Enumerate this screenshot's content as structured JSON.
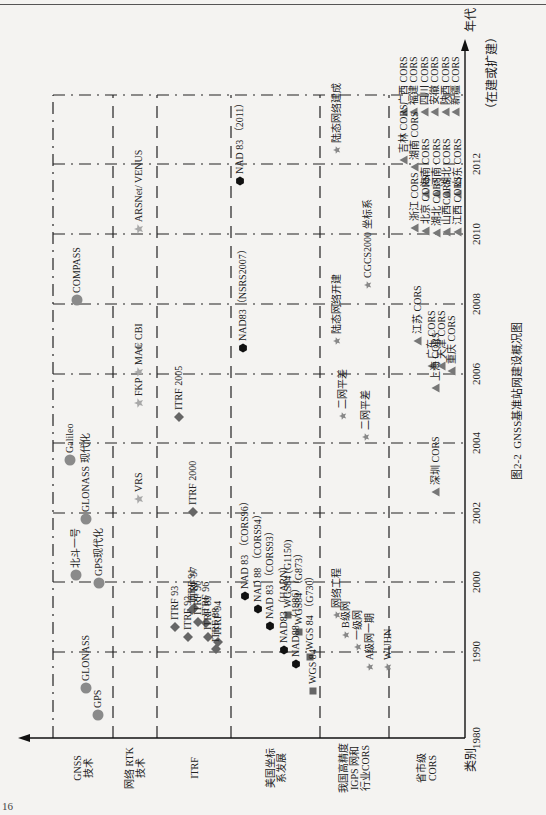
{
  "figure": {
    "caption_number": "图2-2",
    "caption_title": "GNSS基准站网建设概况图",
    "page_number": "16"
  },
  "axes": {
    "x_axis_label": "年代",
    "y_axis_label": "类别",
    "future_label": "（在建或扩建）",
    "years": [
      {
        "label": "1980",
        "x": 77
      },
      {
        "label": "1990",
        "x": 163
      },
      {
        "label": "2000",
        "x": 233
      },
      {
        "label": "2002",
        "x": 302
      },
      {
        "label": "2004",
        "x": 372
      },
      {
        "label": "2006",
        "x": 441
      },
      {
        "label": "2008",
        "x": 511
      },
      {
        "label": "2010",
        "x": 581
      },
      {
        "label": "2012",
        "x": 651
      }
    ]
  },
  "categories": [
    {
      "id": "gnss",
      "label": "GNSS\n技术",
      "y0": 53,
      "y1": 113
    },
    {
      "id": "rtk",
      "label": "网络 RTK\n技术",
      "y0": 113,
      "y1": 157
    },
    {
      "id": "itrf",
      "label": "ITRF",
      "y0": 157,
      "y1": 231
    },
    {
      "id": "nad",
      "label": "美国坐标\n系发展",
      "y0": 231,
      "y1": 320
    },
    {
      "id": "igps",
      "label": "我国高精度\nIGPS 网和\n行业CORS",
      "y0": 320,
      "y1": 389
    },
    {
      "id": "cors",
      "label": "省市级\nCORS",
      "y0": 389,
      "y1": 465
    }
  ],
  "colors": {
    "gnss_circle": "#8a8a8a",
    "rtk_star": "#a8a8a8",
    "itrf_diamond": "#666666",
    "nad_hexagon": "#111111",
    "wgs_square": "#666666",
    "igps_star": "#888888",
    "cors_triangle": "#777777",
    "grid_line": "#222222"
  },
  "items": {
    "gnss": [
      {
        "label": "GPS",
        "x": 100,
        "y": 98
      },
      {
        "label": "GLONASS",
        "x": 127,
        "y": 86
      },
      {
        "label": "北斗一号",
        "x": 240,
        "y": 76
      },
      {
        "label": "GPS现代化",
        "x": 232,
        "y": 99
      },
      {
        "label": "GLONASS 现代化",
        "x": 296,
        "y": 86
      },
      {
        "label": "Galileo",
        "x": 355,
        "y": 70
      },
      {
        "label": "COMPASS",
        "x": 515,
        "y": 77
      }
    ],
    "rtk": [
      {
        "label": "VRS",
        "x": 316,
        "y": 139
      },
      {
        "label": "FKP",
        "x": 412,
        "y": 139
      },
      {
        "label": "MAC",
        "x": 443,
        "y": 139
      },
      {
        "label": "CBI",
        "x": 468,
        "y": 139
      },
      {
        "label": "ARSNet/ VENUS",
        "x": 586,
        "y": 139
      }
    ],
    "itrf": [
      {
        "label": "ITRF 88",
        "x": 166,
        "y": 216
      },
      {
        "label": "ITRF 89",
        "x": 178,
        "y": 208
      },
      {
        "label": "ITRF 90",
        "x": 193,
        "y": 198
      },
      {
        "label": "ITRF 91",
        "x": 205,
        "y": 192
      },
      {
        "label": "ITRF 92",
        "x": 178,
        "y": 188
      },
      {
        "label": "ITRF 93",
        "x": 188,
        "y": 175
      },
      {
        "label": "ITRF 94",
        "x": 173,
        "y": 218
      },
      {
        "label": "ITRF 96",
        "x": 192,
        "y": 206
      },
      {
        "label": "ITRF 97",
        "x": 207,
        "y": 194
      },
      {
        "label": "ITRF 2000",
        "x": 303,
        "y": 193
      },
      {
        "label": "ITRF 2005",
        "x": 398,
        "y": 179
      }
    ],
    "nad": [
      {
        "label": "NAD 83 （CORS96）",
        "x": 219,
        "y": 245,
        "shape": "hex"
      },
      {
        "label": "NAD 88 （CORS94）",
        "x": 206,
        "y": 258,
        "shape": "hex"
      },
      {
        "label": "NAD 83 （CORS93）",
        "x": 189,
        "y": 270,
        "shape": "hex"
      },
      {
        "label": "NAD83 （HARN）",
        "x": 165,
        "y": 284,
        "shape": "hex"
      },
      {
        "label": "NAD88 （1986）",
        "x": 151,
        "y": 296,
        "shape": "hex"
      },
      {
        "label": "NAD83（NSRS2007）",
        "x": 467,
        "y": 243,
        "shape": "hex"
      },
      {
        "label": "NAD 83 （2011）",
        "x": 634,
        "y": 240,
        "shape": "hex"
      },
      {
        "label": "WGS 84",
        "x": 124,
        "y": 313,
        "shape": "square"
      },
      {
        "label": "WGS 84 （G730）",
        "x": 158,
        "y": 310,
        "shape": "square"
      },
      {
        "label": "WGS84 （G873）",
        "x": 183,
        "y": 299,
        "shape": "square"
      },
      {
        "label": "WGS84 (G1150)",
        "x": 200,
        "y": 288,
        "shape": "square"
      }
    ],
    "igps": [
      {
        "label": "网络工程",
        "x": 200,
        "y": 337
      },
      {
        "label": "B级网",
        "x": 180,
        "y": 346
      },
      {
        "label": "一级网",
        "x": 168,
        "y": 358
      },
      {
        "label": "A级网一期",
        "x": 148,
        "y": 370
      },
      {
        "label": "WUHN",
        "x": 148,
        "y": 388
      },
      {
        "label": "二网平差",
        "x": 378,
        "y": 366
      },
      {
        "label": "二网平差",
        "x": 399,
        "y": 343
      },
      {
        "label": "陆态网络开建",
        "x": 474,
        "y": 337
      },
      {
        "label": "CGCS2000 坐标系",
        "x": 530,
        "y": 368
      },
      {
        "label": "陆态网络建成",
        "x": 665,
        "y": 337
      }
    ],
    "cors": [
      {
        "label": "深圳 CORS",
        "x": 323,
        "y": 436
      },
      {
        "label": "上海 CORS",
        "x": 427,
        "y": 436
      },
      {
        "label": "重庆 CORS",
        "x": 444,
        "y": 452
      },
      {
        "label": "天津 CORS",
        "x": 449,
        "y": 442
      },
      {
        "label": "广东 CORS",
        "x": 449,
        "y": 432
      },
      {
        "label": "江苏 CORS",
        "x": 474,
        "y": 418
      },
      {
        "label": "江西 CORS",
        "x": 583,
        "y": 458
      },
      {
        "label": "山西CORS",
        "x": 583,
        "y": 447
      },
      {
        "label": "湖北 CORS",
        "x": 582,
        "y": 437
      },
      {
        "label": "北京 CORS",
        "x": 584,
        "y": 426
      },
      {
        "label": "浙江 CORS",
        "x": 587,
        "y": 415
      },
      {
        "label": "山东 CORS",
        "x": 621,
        "y": 458
      },
      {
        "label": "湖北 CORS",
        "x": 621,
        "y": 447
      },
      {
        "label": "河南 CORS",
        "x": 621,
        "y": 437
      },
      {
        "label": "海南 CORS",
        "x": 621,
        "y": 426
      },
      {
        "label": "湖南 CORS",
        "x": 648,
        "y": 415
      },
      {
        "label": "吉林 CORS",
        "x": 655,
        "y": 404
      },
      {
        "label": "广西 CORS",
        "x": 703,
        "y": 404
      },
      {
        "label": "福建 CORS",
        "x": 703,
        "y": 414
      },
      {
        "label": "四川 CORS",
        "x": 703,
        "y": 425
      },
      {
        "label": "安徽 CORS",
        "x": 703,
        "y": 435
      },
      {
        "label": "陕西 CORS",
        "x": 703,
        "y": 446
      },
      {
        "label": "新疆 CORS",
        "x": 703,
        "y": 456
      }
    ]
  }
}
